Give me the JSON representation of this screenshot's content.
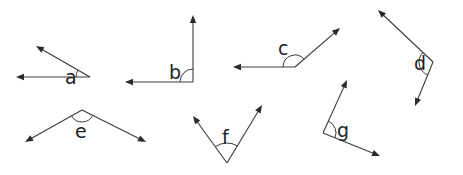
{
  "diagram": {
    "title": "",
    "colors": {
      "line": "#3a3a3a",
      "text": "#222222",
      "background": "#ffffff"
    },
    "angles": [
      {
        "label": "a",
        "vertex": [
          90,
          77
        ],
        "rays": [
          [
            16,
            77
          ],
          [
            36,
            46
          ]
        ],
        "arc_radius": 14,
        "label_pos": [
          65,
          84
        ],
        "type": "acute"
      },
      {
        "label": "b",
        "vertex": [
          193,
          82
        ],
        "rays": [
          [
            125,
            82
          ],
          [
            193,
            15
          ]
        ],
        "arc_radius": 13,
        "label_pos": [
          169,
          79
        ],
        "type": "right"
      },
      {
        "label": "c",
        "vertex": [
          295,
          67
        ],
        "rays": [
          [
            233,
            67
          ],
          [
            340,
            28
          ]
        ],
        "arc_radius": 12,
        "label_pos": [
          278,
          55
        ],
        "type": "obtuse"
      },
      {
        "label": "d",
        "vertex": [
          433,
          62
        ],
        "rays": [
          [
            378,
            10
          ],
          [
            415,
            106
          ]
        ],
        "arc_radius": 14,
        "label_pos": [
          414,
          70
        ],
        "type": "acute"
      },
      {
        "label": "e",
        "vertex": [
          82,
          110
        ],
        "rays": [
          [
            25,
            142
          ],
          [
            146,
            142
          ]
        ],
        "arc_radius": 12,
        "label_pos": [
          75,
          138
        ],
        "type": "obtuse"
      },
      {
        "label": "f",
        "vertex": [
          227,
          163
        ],
        "rays": [
          [
            193,
            116
          ],
          [
            262,
            105
          ]
        ],
        "arc_radius": 20,
        "label_pos": [
          222,
          144
        ],
        "type": "acute"
      },
      {
        "label": "g",
        "vertex": [
          323,
          133
        ],
        "rays": [
          [
            347,
            80
          ],
          [
            380,
            156
          ]
        ],
        "arc_radius": 13,
        "label_pos": [
          337,
          137
        ],
        "type": "acute"
      }
    ]
  }
}
